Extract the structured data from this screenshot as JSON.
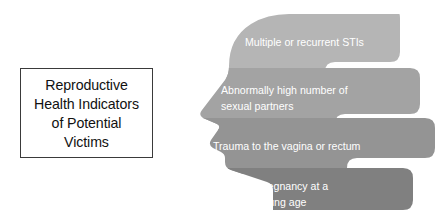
{
  "slide": {
    "background_color": "#ffffff",
    "width": 438,
    "height": 224
  },
  "title_box": {
    "border_color": "#3a3a3a",
    "text_color": "#111111",
    "lines": [
      "Reproductive",
      "Health Indicators",
      "of Potential",
      "Victims"
    ],
    "full_text": "Reproductive Health Indicators of Potential Victims"
  },
  "head_diagram": {
    "shape": "human-head-profile-silhouette",
    "facing": "left",
    "label_color": "#ffffff",
    "bands": [
      {
        "index": 1,
        "color": "#b5b5b5",
        "lines": [
          "Multiple or recurrent STIs"
        ],
        "full_text": "Multiple or recurrent STIs"
      },
      {
        "index": 2,
        "color": "#a3a3a3",
        "lines": [
          "Abnormally high number of",
          "sexual partners"
        ],
        "full_text": "Abnormally high number of sexual partners"
      },
      {
        "index": 3,
        "color": "#949494",
        "lines": [
          "Trauma to the vagina or rectum"
        ],
        "full_text": "Trauma to the vagina or rectum"
      },
      {
        "index": 4,
        "color": "#808080",
        "lines": [
          "Pregnancy at a",
          "young age"
        ],
        "full_text": "Pregnancy at a young age"
      }
    ]
  }
}
